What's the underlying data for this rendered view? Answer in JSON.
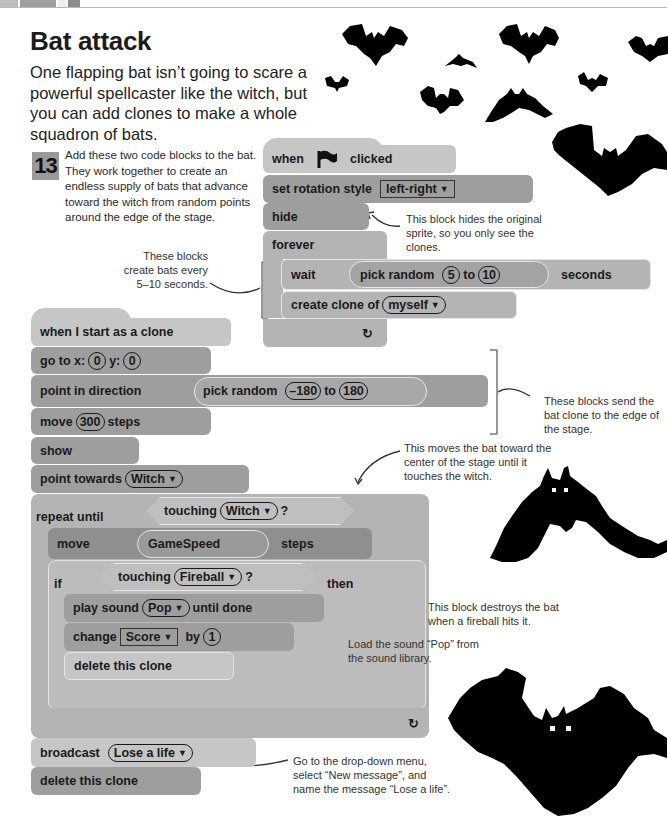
{
  "header": {
    "title": "Bat attack",
    "intro": "One flapping bat isn’t going to scare a powerful spellcaster like the witch, but you can add clones to make a whole squadron of bats."
  },
  "step": {
    "number": "13",
    "text": "Add these two code blocks to the bat. They work together to create an endless supply of bats that advance toward the witch from random points around the edge of the stage."
  },
  "script1": {
    "hat": {
      "when": "when",
      "flag_icon": "green-flag-icon",
      "clicked": "clicked"
    },
    "set_rotation": {
      "label": "set rotation style",
      "value": "left-right"
    },
    "hide": "hide",
    "forever": "forever",
    "wait": {
      "label": "wait",
      "reporter": "pick random",
      "from": "5",
      "to_word": "to",
      "to": "10",
      "suffix": "seconds"
    },
    "create_clone": {
      "label": "create clone of",
      "value": "myself"
    },
    "loop_arrow": "↻"
  },
  "script2": {
    "hat": "when I start as a clone",
    "goto": {
      "label": "go to x:",
      "x": "0",
      "y_label": "y:",
      "y": "0"
    },
    "point_dir": {
      "label": "point in direction",
      "reporter": "pick random",
      "from": "–180",
      "to_word": "to",
      "to": "180"
    },
    "move": {
      "label": "move",
      "value": "300",
      "suffix": "steps"
    },
    "show": "show",
    "point_towards": {
      "label": "point towards",
      "value": "Witch"
    },
    "repeat_until": {
      "label": "repeat until",
      "cond": "touching",
      "value": "Witch",
      "q": "?"
    },
    "move_speed": {
      "label": "move",
      "var": "GameSpeed",
      "suffix": "steps"
    },
    "if_block": {
      "label": "if",
      "cond": "touching",
      "value": "Fireball",
      "q": "?",
      "then": "then"
    },
    "play_sound": {
      "label": "play sound",
      "value": "Pop",
      "suffix": "until done"
    },
    "change": {
      "label": "change",
      "var": "Score",
      "by": "by",
      "value": "1"
    },
    "delete_inner": "delete this clone",
    "broadcast": {
      "label": "broadcast",
      "value": "Lose a life"
    },
    "delete_end": "delete this clone"
  },
  "annotations": {
    "hide": "This block hides the original sprite, so you only see the clones.",
    "every": "These blocks create bats every 5–10 seconds.",
    "edge": "These blocks send the bat clone to the edge of the stage.",
    "toward": "This moves the bat toward the center of the stage until it touches the witch.",
    "destroy": "This block destroys the bat when a fireball hits it.",
    "pop": "Load the sound “Pop” from the sound library.",
    "broadcast": "Go to the drop-down menu, select “New message”, and name the message “Lose a life”."
  },
  "colors": {
    "light_block": "#c6c6c6",
    "dark_block": "#9e9e9e",
    "control_block": "#b4b4b4"
  }
}
